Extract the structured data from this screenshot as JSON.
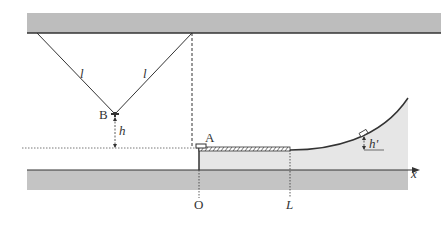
{
  "diagram": {
    "labels": {
      "string_left": "l",
      "string_right": "l",
      "point_b": "B",
      "height_b": "h",
      "point_a": "A",
      "origin": "O",
      "length_mark": "L",
      "height_final": "h'",
      "x_axis": "x"
    },
    "colors": {
      "ceiling": "#b8b8b8",
      "ground": "#c4c4c4",
      "track_fill": "#e6e6e6",
      "line": "#333333"
    }
  }
}
